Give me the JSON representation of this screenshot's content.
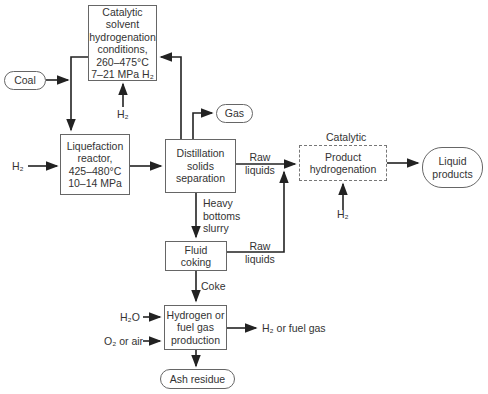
{
  "diagram": {
    "nodes": {
      "catalytic_solvent": {
        "lines": [
          "Catalytic",
          "solvent",
          "hydrogenation",
          "conditions,",
          "260–475°C",
          "7–21 MPa H₂"
        ]
      },
      "coal": {
        "label": "Coal"
      },
      "liquefaction": {
        "lines": [
          "Liquefaction",
          "reactor,",
          "425–480°C",
          "10–14 MPa"
        ]
      },
      "distillation": {
        "lines": [
          "Distillation",
          "solids",
          "separation"
        ]
      },
      "gas": {
        "label": "Gas"
      },
      "product_hydrogenation": {
        "caption": "Catalytic",
        "lines": [
          "Product",
          "hydrogenation"
        ]
      },
      "liquid_products": {
        "lines": [
          "Liquid",
          "products"
        ]
      },
      "fluid_coking": {
        "lines": [
          "Fluid",
          "coking"
        ]
      },
      "hydrogen_production": {
        "lines": [
          "Hydrogen or",
          "fuel gas",
          "production"
        ]
      },
      "ash_residue": {
        "label": "Ash residue"
      }
    },
    "edge_labels": {
      "h2_top": "H₂",
      "h2_left": "H₂",
      "h2_product": "H₂",
      "raw_liquids_1": [
        "Raw",
        "liquids"
      ],
      "raw_liquids_2": [
        "Raw",
        "liquids"
      ],
      "heavy_bottoms": [
        "Heavy",
        "bottoms",
        "slurry"
      ],
      "coke": "Coke",
      "h2o": "H₂O",
      "o2_air": "O₂ or air",
      "h2_fuel_gas": "H₂ or fuel gas"
    }
  }
}
